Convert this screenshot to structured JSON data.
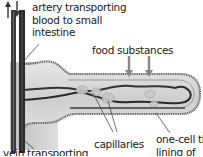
{
  "diagram": {
    "labels": {
      "artery_line1": "artery transporting",
      "artery_line2": "blood to small",
      "artery_line3": "intestine",
      "food": "food substances",
      "capillaries": "capillaries",
      "vein": "vein transporting",
      "lining_line1": "one-cell th",
      "lining_line2": "lining of"
    },
    "colors": {
      "background": "#ffffff",
      "villus_fill": "#d9d9d9",
      "villus_outline": "#6e6e6e",
      "vessel_dark": "#2e2e2e",
      "vessel_mid": "#555555",
      "text": "#1a1a1a"
    }
  }
}
